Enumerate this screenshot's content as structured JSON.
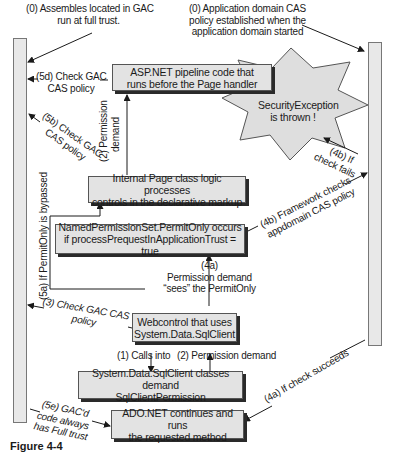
{
  "diagram": {
    "labels": {
      "gac_full_trust": [
        "(0) Assembles located in GAC",
        "run at full trust."
      ],
      "appdomain_policy": [
        "(0) Application domain CAS",
        "policy established when the",
        "application domain started"
      ],
      "check_5d": [
        "(5d) Check GAC",
        "CAS policy"
      ],
      "check_5b": [
        "(5b) Check GAC",
        "CAS policy"
      ],
      "perm_demand_2_top": [
        "(2) Permission",
        "demand"
      ],
      "if_fails_4b": [
        "(4b) If",
        "check fails"
      ],
      "framework_checks_4b": [
        "(4b) Framework checks",
        "appdomain CAS policy"
      ],
      "bypassed_5a": "(5a) If PermitOnly is bypassed",
      "check_3": [
        "(3) Check GAC CAS",
        "policy"
      ],
      "perm_demand_4a": [
        "(4a)",
        "Permission demand",
        "“sees” the PermitOnly"
      ],
      "calls_into_1": "(1) Calls into",
      "perm_demand_2_bottom": "(2) Permission demand",
      "gacd_5e": [
        "(5e) GAC'd",
        "code always",
        "has Full trust"
      ],
      "succeeds_4a": "(4a) If check succeeds"
    },
    "boxes": {
      "aspnet_pipeline": [
        "ASP.NET pipeline code that",
        "runs before the Page handler"
      ],
      "internal_page": [
        "Internal Page class logic processes",
        "controls in the declarative markup"
      ],
      "named_permission": [
        "NamedPermissionSet.PermitOnly occurs",
        "if processPrequestInApplicationTrust = true"
      ],
      "webcontrol": [
        "Webcontrol that uses",
        "System.Data.SqlClient"
      ],
      "sqlclient": [
        "System.Data.SqlClient classes demand",
        "SqlClientPermission"
      ],
      "adonet": [
        "ADO.NET continues and runs",
        "the requested method"
      ]
    },
    "exception_star": [
      "SecurityException",
      "is thrown !"
    ],
    "left_bar": "GAC trust column",
    "right_bar": "Application domain CAS policy column",
    "colors": {
      "box_fill": "#e3e3e3",
      "box_shadow": "#2a2a2a",
      "star_fill": "#dedede",
      "bar_fill": "#e8e8e8",
      "line": "#1a1a1a"
    },
    "caption": "Figure 4-4"
  }
}
